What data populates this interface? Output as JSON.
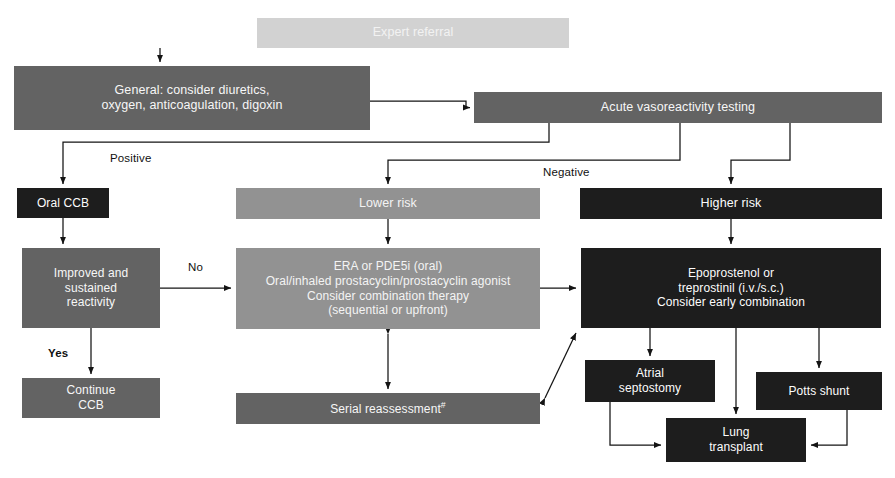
{
  "diagram": {
    "type": "flowchart",
    "canvas": {
      "width": 895,
      "height": 478
    },
    "palette": {
      "light_gray": "#d2d2d2",
      "mid_gray": "#929292",
      "dark_gray": "#636363",
      "near_black": "#1d1d1d",
      "text_on_fill": "#ffffff",
      "edge_label_text": "#111111",
      "connector": "#1a1a1a",
      "background": "#ffffff"
    },
    "nodes": [
      {
        "id": "expert-referral",
        "label": "Expert referral",
        "tone": "light",
        "x": 257,
        "y": 18,
        "w": 312,
        "h": 30,
        "font_size": 12.5
      },
      {
        "id": "general-measures",
        "label": "General: consider diuretics,\noxygen, anticoagulation, digoxin",
        "tone": "dark",
        "x": 14,
        "y": 66,
        "w": 356,
        "h": 64,
        "font_size": 12.5
      },
      {
        "id": "acute-vasoreactivity-testing",
        "label": "Acute vasoreactivity testing",
        "tone": "dark",
        "x": 474,
        "y": 92,
        "w": 408,
        "h": 31,
        "font_size": 12.5
      },
      {
        "id": "oral-ccb",
        "label": "Oral CCB",
        "tone": "black",
        "x": 17,
        "y": 188,
        "w": 92,
        "h": 30,
        "font_size": 12
      },
      {
        "id": "lower-risk",
        "label": "Lower risk",
        "tone": "mid",
        "x": 236,
        "y": 188,
        "w": 304,
        "h": 31,
        "font_size": 12.5
      },
      {
        "id": "higher-risk",
        "label": "Higher risk",
        "tone": "black",
        "x": 580,
        "y": 188,
        "w": 302,
        "h": 31,
        "font_size": 12.5
      },
      {
        "id": "improved-sustained-reactivity",
        "label": "Improved and\nsustained\nreactivity",
        "tone": "dark",
        "x": 22,
        "y": 248,
        "w": 138,
        "h": 80,
        "font_size": 12
      },
      {
        "id": "era-pde5i-regimen",
        "label": "ERA or PDE5i (oral)\nOral/inhaled prostacyclin/prostacyclin agonist\nConsider combination therapy\n(sequential or upfront)",
        "tone": "mid",
        "x": 236,
        "y": 248,
        "w": 304,
        "h": 81,
        "font_size": 12
      },
      {
        "id": "epoprostenol-treprostinil",
        "label": "Epoprostenol or\ntreprostinil (i.v./s.c.)\nConsider early combination",
        "tone": "black",
        "x": 581,
        "y": 248,
        "w": 300,
        "h": 80,
        "font_size": 12
      },
      {
        "id": "continue-ccb",
        "label": "Continue\nCCB",
        "tone": "dark",
        "x": 22,
        "y": 378,
        "w": 138,
        "h": 40,
        "font_size": 12
      },
      {
        "id": "serial-reassessment",
        "label": "Serial reassessment",
        "label_superscript": "#",
        "tone": "dark",
        "x": 236,
        "y": 393,
        "w": 304,
        "h": 31,
        "font_size": 12
      },
      {
        "id": "atrial-septostomy",
        "label": "Atrial\nseptostomy",
        "tone": "black",
        "x": 585,
        "y": 360,
        "w": 130,
        "h": 42,
        "font_size": 12
      },
      {
        "id": "potts-shunt",
        "label": "Potts shunt",
        "tone": "black",
        "x": 756,
        "y": 372,
        "w": 126,
        "h": 38,
        "font_size": 12
      },
      {
        "id": "lung-transplant",
        "label": "Lung\ntransplant",
        "tone": "black",
        "x": 666,
        "y": 418,
        "w": 140,
        "h": 44,
        "font_size": 12
      }
    ],
    "edge_labels": [
      {
        "id": "edge-label-positive",
        "text": "Positive",
        "x": 110,
        "y": 152
      },
      {
        "id": "edge-label-negative",
        "text": "Negative",
        "x": 543,
        "y": 166
      },
      {
        "id": "edge-label-no",
        "text": "No",
        "x": 188,
        "y": 261
      },
      {
        "id": "edge-label-yes",
        "text": "Yes",
        "x": 48,
        "y": 347
      }
    ],
    "connections": [
      {
        "from": "expert-referral",
        "to": "general-measures",
        "arrow": "single"
      },
      {
        "from": "general-measures",
        "to": "acute-vasoreactivity-testing",
        "arrow": "single"
      },
      {
        "from": "acute-vasoreactivity-testing",
        "to": "oral-ccb",
        "arrow": "single",
        "label": "Positive"
      },
      {
        "from": "acute-vasoreactivity-testing",
        "to": "lower-risk",
        "arrow": "single",
        "label": "Negative"
      },
      {
        "from": "acute-vasoreactivity-testing",
        "to": "higher-risk",
        "arrow": "single",
        "label": "Negative"
      },
      {
        "from": "oral-ccb",
        "to": "improved-sustained-reactivity",
        "arrow": "single"
      },
      {
        "from": "improved-sustained-reactivity",
        "to": "era-pde5i-regimen",
        "arrow": "single",
        "label": "No"
      },
      {
        "from": "improved-sustained-reactivity",
        "to": "continue-ccb",
        "arrow": "single",
        "label": "Yes"
      },
      {
        "from": "lower-risk",
        "to": "era-pde5i-regimen",
        "arrow": "single"
      },
      {
        "from": "higher-risk",
        "to": "epoprostenol-treprostinil",
        "arrow": "single"
      },
      {
        "from": "era-pde5i-regimen",
        "to": "epoprostenol-treprostinil",
        "arrow": "single"
      },
      {
        "from": "era-pde5i-regimen",
        "to": "serial-reassessment",
        "arrow": "double"
      },
      {
        "from": "serial-reassessment",
        "to": "epoprostenol-treprostinil",
        "arrow": "double"
      },
      {
        "from": "epoprostenol-treprostinil",
        "to": "atrial-septostomy",
        "arrow": "single"
      },
      {
        "from": "epoprostenol-treprostinil",
        "to": "potts-shunt",
        "arrow": "single"
      },
      {
        "from": "epoprostenol-treprostinil",
        "to": "lung-transplant",
        "arrow": "single"
      },
      {
        "from": "atrial-septostomy",
        "to": "lung-transplant",
        "arrow": "single"
      },
      {
        "from": "potts-shunt",
        "to": "lung-transplant",
        "arrow": "single"
      }
    ]
  }
}
